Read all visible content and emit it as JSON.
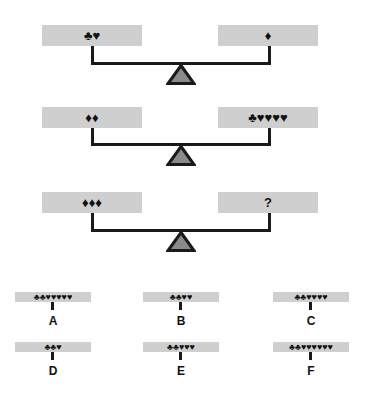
{
  "puzzle": {
    "scales": [
      {
        "left": "♣♥",
        "right": "♦"
      },
      {
        "left": "♦♦",
        "right": "♣♥♥♥♥"
      },
      {
        "left": "♦♦♦",
        "right": "?"
      }
    ],
    "options": [
      {
        "label": "A",
        "symbols": "♣♣♥♥♥♥♥"
      },
      {
        "label": "B",
        "symbols": "♣♣♥♥"
      },
      {
        "label": "C",
        "symbols": "♣♣♥♥♥♥"
      },
      {
        "label": "D",
        "symbols": "♣♣♥"
      },
      {
        "label": "E",
        "symbols": "♣♣♥♥♥"
      },
      {
        "label": "F",
        "symbols": "♣♣♥♥♥♥♥♥"
      }
    ],
    "colors": {
      "pan": "#cfcfcf",
      "line": "#1a1a1a",
      "fulcrum_fill": "#8a8a8a"
    }
  }
}
